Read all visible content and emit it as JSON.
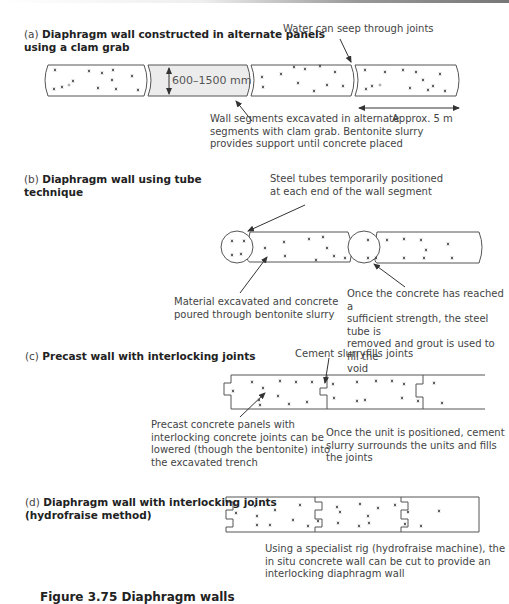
{
  "figure": {
    "caption": "Figure 3.75 Diaphragm walls"
  },
  "panels": [
    {
      "label": "(a)",
      "title_line1": "Diaphragm wall constructed in alternate panels",
      "title_line2": "using a clam grab",
      "dimension_label": "600–1500 mm",
      "notes": {
        "joints": "Water can seep through joints",
        "segments_line1": "Wall segments excavated in alternate",
        "segments_line2": "segments with clam grab. Bentonite slurry",
        "segments_line3": "provides support until concrete placed",
        "length": "Approx. 5 m"
      }
    },
    {
      "label": "(b)",
      "title_line1": "Diaphragm wall using tube",
      "title_line2": "technique",
      "notes": {
        "tubes_line1": "Steel tubes temporarily positioned",
        "tubes_line2": "at each end of the wall segment",
        "material_line1": "Material excavated and concrete",
        "material_line2": "poured through bentonite slurry",
        "grout_line1": "Once the concrete has reached a",
        "grout_line2": "sufficient strength, the steel tube is",
        "grout_line3": "removed and grout is used to fill the",
        "grout_line4": "void"
      }
    },
    {
      "label": "(c)",
      "title_line1": "Precast wall with interlocking joints",
      "notes": {
        "slurry": "Cement slurryfills joints",
        "precast_line1": "Precast concrete panels with",
        "precast_line2": "interlocking concrete joints can be",
        "precast_line3": "lowered (though the bentonite) into",
        "precast_line4": "the excavated trench",
        "unit_line1": "Once the unit is positioned, cement",
        "unit_line2": "slurry surrounds the units and fills",
        "unit_line3": "the joints"
      }
    },
    {
      "label": "(d)",
      "title_line1": "Diaphragm wall with interlocking joints",
      "title_line2": "(hydrofraise method)",
      "notes": {
        "rig_line1": "Using a specialist rig (hydrofraise machine), the",
        "rig_line2": "in situ concrete wall can be cut to provide an",
        "rig_line3": "interlocking diaphragm wall"
      }
    }
  ],
  "colors": {
    "line": "#555555",
    "excavated_fill": "#ececec",
    "text": "#444444"
  }
}
